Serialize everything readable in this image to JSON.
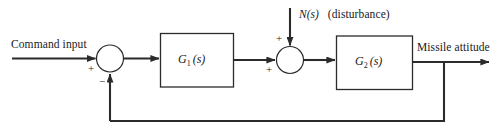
{
  "diagram": {
    "type": "control-system-block-diagram",
    "title_visible": false,
    "colors": {
      "background": "#ffffff",
      "line": "#2b2b2b",
      "text": "#1a1a1a"
    },
    "input": {
      "label": "Command input"
    },
    "disturbance": {
      "symbol": "N(s)",
      "symbol_base": "N",
      "symbol_arg": "(s)",
      "note": "(disturbance)"
    },
    "output": {
      "label": "Missile attitude"
    },
    "blocks": [
      {
        "id": "g1",
        "base": "G",
        "subscript": "1",
        "arg": "(s)",
        "label": "G1(s)"
      },
      {
        "id": "g2",
        "base": "G",
        "subscript": "2",
        "arg": "(s)",
        "label": "G2(s)"
      }
    ],
    "summing_junctions": [
      {
        "id": "sum1",
        "signs": {
          "input_left": "+",
          "feedback_bottom": "−"
        }
      },
      {
        "id": "sum2",
        "signs": {
          "input_left": "+",
          "disturbance_top": "+"
        }
      }
    ],
    "feedback": {
      "description": "unity feedback from output takeoff node to first summing junction",
      "sign": "−"
    }
  }
}
